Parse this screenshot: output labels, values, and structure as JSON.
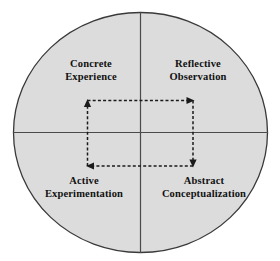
{
  "diagram": {
    "type": "quadrant-circle",
    "background_color": "#ffffff",
    "circle": {
      "fill_color": "#dcdcdc",
      "stroke_color": "#3a3a3a",
      "center_x": 140.5,
      "center_y": 132.5,
      "radius_x": 127.5,
      "radius_y": 120.5
    },
    "axes": {
      "stroke_color": "#4a4a4a",
      "vertical_x": 140.5,
      "horizontal_y": 132.5
    },
    "quadrants": [
      {
        "id": "concrete-experience",
        "position": "top-left",
        "line1": "Concrete",
        "line2": "Experience"
      },
      {
        "id": "reflective-observation",
        "position": "top-right",
        "line1": "Reflective",
        "line2": "Observation"
      },
      {
        "id": "active-experimentation",
        "position": "bottom-left",
        "line1": "Active",
        "line2": "Experimentation"
      },
      {
        "id": "abstract-conceptualization",
        "position": "bottom-right",
        "line1": "Abstract",
        "line2": "Conceptualization"
      }
    ],
    "cycle_arrows": {
      "stroke_color": "#1a1a1a",
      "style": "dashed",
      "dash_pattern": "3,2.2",
      "rect": {
        "left": 87,
        "top": 100.5,
        "right": 193,
        "bottom": 166
      },
      "segments": [
        {
          "id": "left-edge-up",
          "from": "bottom-left",
          "to": "top-left",
          "direction": "up"
        },
        {
          "id": "top-edge-right",
          "from": "top-left",
          "to": "top-right",
          "direction": "right"
        },
        {
          "id": "right-edge-down",
          "from": "top-right",
          "to": "bottom-right",
          "direction": "down"
        },
        {
          "id": "bottom-edge-left",
          "from": "bottom-right",
          "to": "bottom-left",
          "direction": "left"
        }
      ]
    }
  }
}
